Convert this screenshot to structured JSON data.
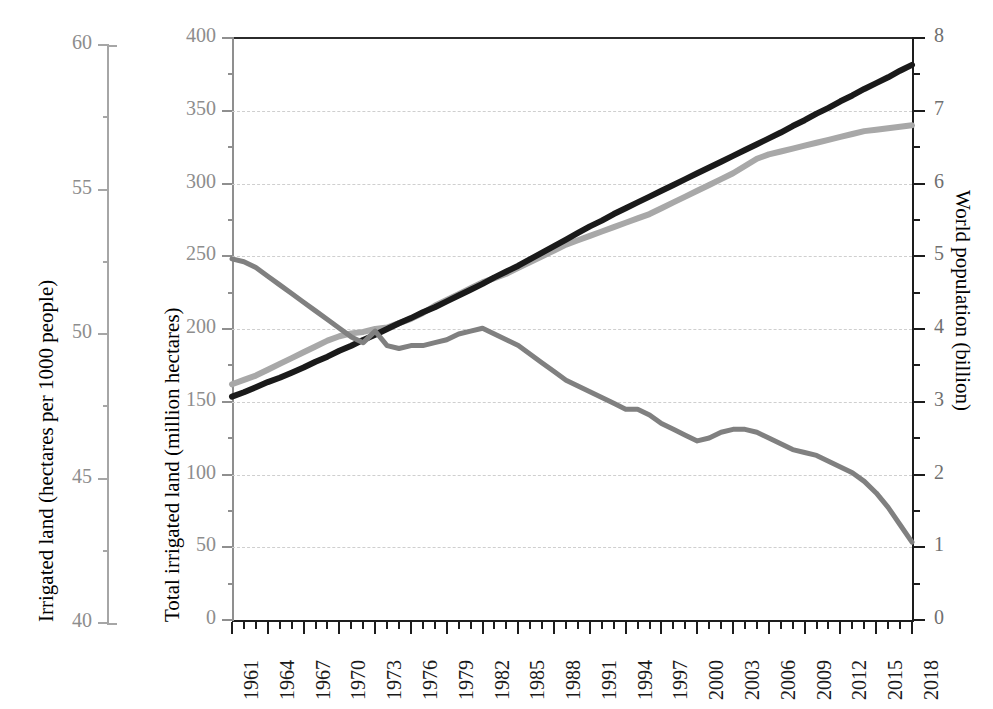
{
  "chart_data": {
    "type": "line",
    "title": "",
    "grid": true,
    "legend_position": "none",
    "x": [
      1961,
      1962,
      1963,
      1964,
      1965,
      1966,
      1967,
      1968,
      1969,
      1970,
      1971,
      1972,
      1973,
      1974,
      1975,
      1976,
      1977,
      1978,
      1979,
      1980,
      1981,
      1982,
      1983,
      1984,
      1985,
      1986,
      1987,
      1988,
      1989,
      1990,
      1991,
      1992,
      1993,
      1994,
      1995,
      1996,
      1997,
      1998,
      1999,
      2000,
      2001,
      2002,
      2003,
      2004,
      2005,
      2006,
      2007,
      2008,
      2009,
      2010,
      2011,
      2012,
      2013,
      2014,
      2015,
      2016,
      2017,
      2018
    ],
    "xlabel": "",
    "xtick_labels": [
      "1961",
      "1964",
      "1967",
      "1970",
      "1973",
      "1976",
      "1979",
      "1982",
      "1985",
      "1988",
      "1991",
      "1994",
      "1997",
      "2000",
      "2003",
      "2006",
      "2009",
      "2012",
      "2015",
      "2018"
    ],
    "xlim": [
      1961,
      2018
    ],
    "axes": [
      {
        "id": "outer-left",
        "ylabel": "Irrigated land (hectares per 1000 people)",
        "ylim": [
          40,
          60
        ],
        "ytick_labels": [
          "60",
          "55",
          "50",
          "45",
          "40"
        ],
        "ytick_values": [
          60,
          55,
          50,
          45,
          40
        ],
        "minor_tick_step": 2.5
      },
      {
        "id": "inner-left",
        "ylabel": "Total irrigated land (million hectares)",
        "ylim": [
          0,
          400
        ],
        "ytick_labels": [
          "400",
          "350",
          "300",
          "250",
          "200",
          "150",
          "100",
          "50",
          "0"
        ],
        "ytick_values": [
          400,
          350,
          300,
          250,
          200,
          150,
          100,
          50,
          0
        ],
        "minor_tick_step": 25
      },
      {
        "id": "right",
        "ylabel": "World population (billion)",
        "ylim": [
          0,
          8
        ],
        "ytick_labels": [
          "8",
          "7",
          "6",
          "5",
          "4",
          "3",
          "2",
          "1",
          "0"
        ],
        "ytick_values": [
          8,
          7,
          6,
          5,
          4,
          3,
          2,
          1,
          0
        ],
        "minor_tick_step": 0.5
      }
    ],
    "series": [
      {
        "name": "Irrigated land per 1000 people",
        "axis": "outer-left",
        "color": "#808080",
        "width": 5,
        "units": "hectares per 1000 people",
        "values": [
          52.6,
          52.5,
          52.3,
          52.0,
          51.7,
          51.4,
          51.1,
          50.8,
          50.5,
          50.2,
          49.9,
          49.7,
          50.1,
          49.6,
          49.5,
          49.6,
          49.6,
          49.7,
          49.8,
          50.0,
          50.1,
          50.2,
          50.0,
          49.8,
          49.6,
          49.3,
          49.0,
          48.7,
          48.4,
          48.2,
          48.0,
          47.8,
          47.6,
          47.4,
          47.4,
          47.2,
          46.9,
          46.7,
          46.5,
          46.3,
          46.4,
          46.6,
          46.7,
          46.7,
          46.6,
          46.4,
          46.2,
          46.0,
          45.9,
          45.8,
          45.6,
          45.4,
          45.2,
          44.9,
          44.5,
          44.0,
          43.4,
          42.8
        ]
      },
      {
        "name": "Total irrigated land",
        "axis": "inner-left",
        "color": "#a8a8a8",
        "width": 6,
        "units": "million hectares",
        "values": [
          162,
          165,
          168,
          172,
          176,
          180,
          184,
          188,
          192,
          195,
          197,
          198,
          200,
          201,
          204,
          207,
          211,
          216,
          220,
          224,
          228,
          232,
          235,
          238,
          242,
          246,
          250,
          254,
          258,
          261,
          264,
          267,
          270,
          273,
          276,
          279,
          283,
          287,
          291,
          295,
          299,
          303,
          307,
          312,
          317,
          320,
          322,
          324,
          326,
          328,
          330,
          332,
          334,
          336,
          337,
          338,
          339,
          340
        ]
      },
      {
        "name": "World population",
        "axis": "right",
        "color": "#1a1a1a",
        "width": 6,
        "units": "billion",
        "values": [
          3.07,
          3.13,
          3.2,
          3.27,
          3.33,
          3.4,
          3.47,
          3.55,
          3.62,
          3.7,
          3.77,
          3.85,
          3.92,
          4.0,
          4.08,
          4.15,
          4.23,
          4.3,
          4.38,
          4.46,
          4.54,
          4.62,
          4.71,
          4.79,
          4.87,
          4.96,
          5.05,
          5.14,
          5.23,
          5.32,
          5.41,
          5.49,
          5.58,
          5.66,
          5.74,
          5.82,
          5.9,
          5.98,
          6.06,
          6.14,
          6.22,
          6.3,
          6.38,
          6.46,
          6.54,
          6.62,
          6.7,
          6.79,
          6.87,
          6.96,
          7.04,
          7.13,
          7.21,
          7.3,
          7.38,
          7.46,
          7.55,
          7.63
        ]
      }
    ]
  },
  "left_outer_axis": {
    "title": "Irrigated land (hectares per 1000 people)",
    "labels": [
      "60",
      "55",
      "50",
      "45",
      "40"
    ]
  },
  "left_inner_axis": {
    "title": "Total irrigated land (million hectares)",
    "labels": [
      "400",
      "350",
      "300",
      "250",
      "200",
      "150",
      "100",
      "50",
      "0"
    ]
  },
  "right_axis": {
    "title": "World population (billion)",
    "labels": [
      "8",
      "7",
      "6",
      "5",
      "4",
      "3",
      "2",
      "1",
      "0"
    ]
  },
  "x_axis": {
    "labels": [
      "1961",
      "1964",
      "1967",
      "1970",
      "1973",
      "1976",
      "1979",
      "1982",
      "1985",
      "1988",
      "1991",
      "1994",
      "1997",
      "2000",
      "2003",
      "2006",
      "2009",
      "2012",
      "2015",
      "2018"
    ]
  },
  "colors": {
    "population_line": "#1a1a1a",
    "total_irrigated_line": "#a8a8a8",
    "per_capita_line": "#808080",
    "gridline": "#cfcfcf",
    "outer_axis": "#a6a6a6",
    "tick_text": "#8d8d8d"
  }
}
